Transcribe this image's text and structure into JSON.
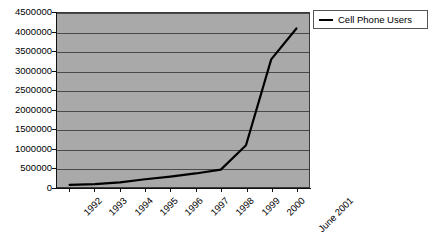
{
  "chart_data": {
    "type": "line",
    "title": "",
    "subtitle": "",
    "xlabel": "",
    "ylabel": "",
    "categories": [
      "1992",
      "1993",
      "1994",
      "1995",
      "1996",
      "1997",
      "1998",
      "1999",
      "2000",
      "June 2001"
    ],
    "series": [
      {
        "name": "Cell Phone Users",
        "color": "#000000",
        "values": [
          55000,
          75000,
          120000,
          200000,
          270000,
          350000,
          450000,
          1080000,
          3300000,
          4100000
        ]
      }
    ],
    "ylim": [
      0,
      4500000
    ],
    "ytick_values": [
      0,
      500000,
      1000000,
      1500000,
      2000000,
      2500000,
      3000000,
      3500000,
      4000000,
      4500000
    ],
    "ytick_labels": [
      "0",
      "500000",
      "1000000",
      "1500000",
      "2000000",
      "2500000",
      "3000000",
      "3500000",
      "4000000",
      "4500000"
    ],
    "grid": true,
    "grid_axis": "y",
    "legend_position": "top-right",
    "legend_entries": [
      "Cell Phone Users"
    ],
    "plot_background": "#a9a9a9",
    "figure_background": "#ffffff",
    "gridline_color": "#4a4a4a",
    "axis_color": "#111111",
    "xtick_label_rotation": -45
  },
  "legend": {
    "item_label": "Cell Phone Users"
  }
}
